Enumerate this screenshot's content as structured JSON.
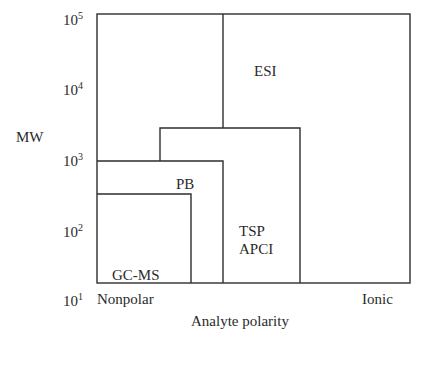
{
  "diagram": {
    "y_axis": {
      "label": "MW",
      "ticks": [
        {
          "base": "10",
          "exp": "5"
        },
        {
          "base": "10",
          "exp": "4"
        },
        {
          "base": "10",
          "exp": "3"
        },
        {
          "base": "10",
          "exp": "2"
        },
        {
          "base": "10",
          "exp": "1"
        }
      ]
    },
    "x_axis": {
      "label": "Analyte polarity",
      "left_end": "Nonpolar",
      "right_end": "Ionic"
    },
    "regions": {
      "esi": {
        "label": "ESI"
      },
      "pb": {
        "label": "PB"
      },
      "tsp_apci": {
        "line1": "TSP",
        "line2": "APCI"
      },
      "gcms": {
        "label": "GC-MS"
      }
    },
    "colors": {
      "line": "#2e2e2e",
      "text": "#2a2a2a",
      "background": "#ffffff"
    }
  }
}
